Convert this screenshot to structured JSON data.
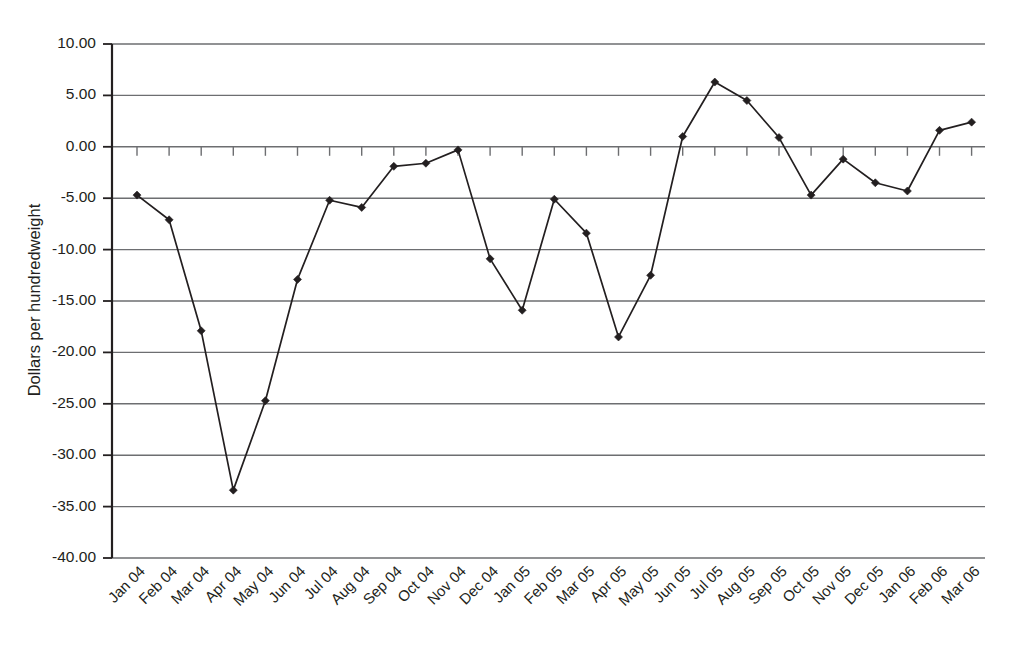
{
  "chart_data": {
    "type": "line",
    "title": "",
    "subtitle": "",
    "xlabel": "",
    "ylabel": "Dollars per hundredweight",
    "ylim": [
      -40.0,
      10.0
    ],
    "ytick_step": 5.0,
    "ytick_labels": [
      "10.00",
      "5.00",
      "0.00",
      "-5.00",
      "-10.00",
      "-15.00",
      "-20.00",
      "-25.00",
      "-30.00",
      "-35.00",
      "-40.00"
    ],
    "ytick_values": [
      10.0,
      5.0,
      0.0,
      -5.0,
      -10.0,
      -15.0,
      -20.0,
      -25.0,
      -30.0,
      -35.0,
      -40.0
    ],
    "grid": true,
    "grid_axis": "y",
    "legend": false,
    "legend_position": "none",
    "marker": "diamond",
    "line_color": "#231f20",
    "grid_color": "#6d6e71",
    "categories": [
      "Jan 04",
      "Feb 04",
      "Mar 04",
      "Apr 04",
      "May 04",
      "Jun 04",
      "Jul 04",
      "Aug 04",
      "Sep 04",
      "Oct 04",
      "Nov 04",
      "Dec 04",
      "Jan 05",
      "Feb 05",
      "Mar 05",
      "Apr 05",
      "May 05",
      "Jun 05",
      "Jul 05",
      "Aug 05",
      "Sep 05",
      "Oct 05",
      "Nov 05",
      "Dec 05",
      "Jan 06",
      "Feb 06",
      "Mar 06"
    ],
    "values": [
      -4.7,
      -7.1,
      -17.9,
      -33.4,
      -24.7,
      -12.9,
      -5.2,
      -5.9,
      -1.9,
      -1.6,
      -0.3,
      -10.9,
      -15.9,
      -5.1,
      -8.4,
      -18.5,
      -12.5,
      1.0,
      6.3,
      4.5,
      0.9,
      -4.7,
      -1.2,
      -3.5,
      -4.3,
      1.6,
      2.4
    ],
    "series": [
      {
        "name": "Dollars per hundredweight",
        "values": [
          -4.7,
          -7.1,
          -17.9,
          -33.4,
          -24.7,
          -12.9,
          -5.2,
          -5.9,
          -1.9,
          -1.6,
          -0.3,
          -10.9,
          -15.9,
          -5.1,
          -8.4,
          -18.5,
          -12.5,
          1.0,
          6.3,
          4.5,
          0.9,
          -4.7,
          -1.2,
          -3.5,
          -4.3,
          1.6,
          2.4
        ]
      }
    ]
  }
}
